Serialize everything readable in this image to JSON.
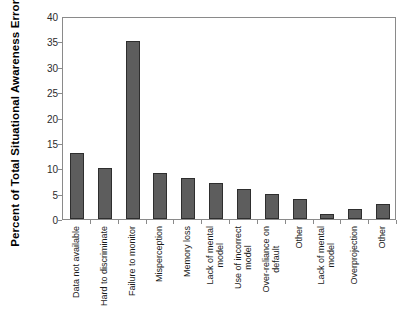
{
  "chart_data": {
    "type": "bar",
    "title": "",
    "subtitle": "",
    "xlabel": "",
    "ylabel": "Percent of Total Situational Awareness Errors",
    "ylim": [
      0,
      40
    ],
    "yticks": [
      0,
      5,
      10,
      15,
      20,
      25,
      30,
      35,
      40
    ],
    "ytick_labels": [
      "0",
      "5",
      "10",
      "15",
      "20",
      "25",
      "30",
      "35",
      "40"
    ],
    "grid": false,
    "legend": null,
    "bar_color": "#5d5d5d",
    "bar_edge_color": "#2e2e2e",
    "axis_color": "#8a8a8a",
    "categories": [
      "Data not available",
      "Hard to discriminate",
      "Failure to monitor",
      "Misperception",
      "Memory loss",
      "Lack of mental model",
      "Use of incorrect model",
      "Over-reliance on default",
      "Other",
      "Lack of mental model",
      "Overprojection",
      "Other"
    ],
    "category_lines": [
      [
        "Data not available"
      ],
      [
        "Hard to discriminate"
      ],
      [
        "Failure to monitor"
      ],
      [
        "Misperception"
      ],
      [
        "Memory loss"
      ],
      [
        "Lack of mental",
        "model"
      ],
      [
        "Use of incorrect",
        "model"
      ],
      [
        "Over-reliance on",
        "default"
      ],
      [
        "Other"
      ],
      [
        "Lack of mental",
        "model"
      ],
      [
        "Overprojection"
      ],
      [
        "Other"
      ]
    ],
    "values": [
      13,
      10,
      35,
      9,
      8,
      7,
      6,
      5,
      4,
      1,
      2,
      3
    ]
  }
}
